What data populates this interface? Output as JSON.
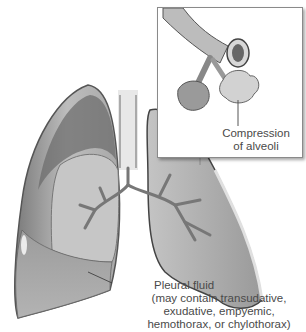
{
  "diagram": {
    "inset": {
      "label_line1": "Compression",
      "label_line2": "of alveoli"
    },
    "callout": {
      "title": "Pleural fluid",
      "detail_lines": [
        "(may contain transudative,",
        "exudative, empyemic,",
        "hemothorax, or chylothorax)"
      ]
    },
    "colors": {
      "lung_fill": "#b9b9b9",
      "lung_dark": "#6e6e6e",
      "pleura_edge": "#d8d8d8",
      "fluid_fill": "#a4a4a4",
      "label_text": "#4a4a4a",
      "background": "#ffffff"
    }
  }
}
